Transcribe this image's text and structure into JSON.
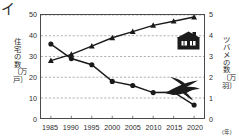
{
  "page": {
    "cropped_character": "イ"
  },
  "chart_data": {
    "type": "line",
    "title": "",
    "xlabel": "",
    "x_unit": "(年)",
    "categories": [
      "1985",
      "1990",
      "1995",
      "2000",
      "2005",
      "2010",
      "2015",
      "2020"
    ],
    "x": [
      1985,
      1990,
      1995,
      2000,
      2005,
      2010,
      2015,
      2020
    ],
    "grid": true,
    "legend": "none",
    "axes": {
      "left": {
        "label": "住宅の数（万戸）",
        "label_chars": "住宅の数〔万戸〕",
        "ticks": [
          "0",
          "10",
          "20",
          "30",
          "40",
          "50"
        ],
        "ylim": [
          0,
          50
        ],
        "step": 10
      },
      "right": {
        "label": "ツバメの数（万羽）",
        "label_chars": "ツバメの数〔万羽〕",
        "ticks": [
          "0",
          "1",
          "2",
          "3",
          "4",
          "5"
        ],
        "ylim": [
          0,
          5
        ],
        "step": 1
      }
    },
    "series": [
      {
        "name": "住宅の数",
        "axis": "left",
        "marker": "circle",
        "color": "#1a1a1a",
        "values": [
          36,
          29,
          26,
          18,
          16,
          12.6,
          12.8,
          6.6
        ]
      },
      {
        "name": "ツバメの数",
        "axis": "right",
        "marker": "triangle",
        "color": "#1a1a1a",
        "values": [
          2.8,
          3.1,
          3.5,
          3.9,
          4.2,
          4.5,
          4.7,
          4.9
        ]
      }
    ],
    "annotations": [
      {
        "name": "house-icon",
        "icon": "house-icon",
        "near_series": "住宅の数"
      },
      {
        "name": "swallow-icon",
        "icon": "swallow-icon",
        "near_series": "ツバメの数"
      }
    ]
  }
}
